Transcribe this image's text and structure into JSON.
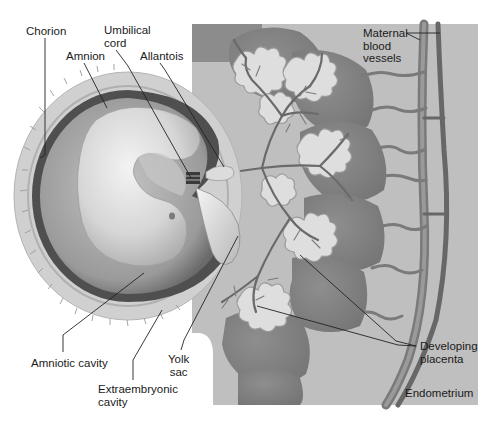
{
  "diagram": {
    "colors": {
      "background": "#ffffff",
      "endometrium": "#bdbdbd",
      "endometrium_dark": "#8a8a8a",
      "vessel": "#6e6e6e",
      "vessel_light": "#a3a3a3",
      "chorion_outer": "#cfcfcf",
      "amnion_dark": "#4a4a4a",
      "cavity": "#9c9c9c",
      "embryo": "#e6e6e6",
      "villi_light": "#e2e2e2",
      "label_text": "#1a1a1a",
      "leader_line": "#222222"
    },
    "labels": [
      {
        "id": "chorion",
        "text": "Chorion",
        "x": 26,
        "y": 25,
        "line": [
          [
            45,
            38
          ],
          [
            45,
            155
          ],
          [
            40,
            158
          ]
        ]
      },
      {
        "id": "umbilical-cord",
        "text": "Umbilical\ncord",
        "x": 104,
        "y": 24,
        "line": [
          [
            116,
            50
          ],
          [
            128,
            66
          ],
          [
            191,
            178
          ]
        ]
      },
      {
        "id": "amnion",
        "text": "Amnion",
        "x": 66,
        "y": 50,
        "line": [
          [
            84,
            63
          ],
          [
            107,
            108
          ]
        ]
      },
      {
        "id": "allantois",
        "text": "Allantois",
        "x": 140,
        "y": 50,
        "line": [
          [
            160,
            63
          ],
          [
            165,
            70
          ],
          [
            224,
            167
          ]
        ]
      },
      {
        "id": "maternal-blood-vessels",
        "text": "Maternal\nblood\nvessels",
        "x": 363,
        "y": 27,
        "line": [
          [
            406,
            33
          ],
          [
            440,
            33
          ]
        ],
        "line2": [
          [
            406,
            33
          ],
          [
            420,
            40
          ]
        ]
      },
      {
        "id": "amniotic-cavity",
        "text": "Amniotic cavity",
        "x": 31,
        "y": 357,
        "line": [
          [
            63,
            352
          ],
          [
            63,
            335
          ],
          [
            144,
            273
          ]
        ]
      },
      {
        "id": "yolk-sac",
        "text": "Yolk\nsac",
        "x": 168,
        "y": 353,
        "line": [
          [
            181,
            350
          ],
          [
            184,
            340
          ],
          [
            238,
            236
          ]
        ]
      },
      {
        "id": "extraembryonic-cavity",
        "text": "Extraembryonic\ncavity",
        "x": 98,
        "y": 383,
        "line": [
          [
            133,
            380
          ],
          [
            133,
            360
          ],
          [
            162,
            310
          ]
        ]
      },
      {
        "id": "developing-placenta",
        "text": "Developing\nplacenta",
        "x": 420,
        "y": 340,
        "line": [
          [
            416,
            346
          ],
          [
            396,
            341
          ],
          [
            300,
            255
          ]
        ],
        "line2": [
          [
            416,
            346
          ],
          [
            398,
            345
          ],
          [
            257,
            306
          ]
        ]
      },
      {
        "id": "endometrium",
        "text": "Endometrium",
        "x": 405,
        "y": 387,
        "line": null
      }
    ]
  }
}
